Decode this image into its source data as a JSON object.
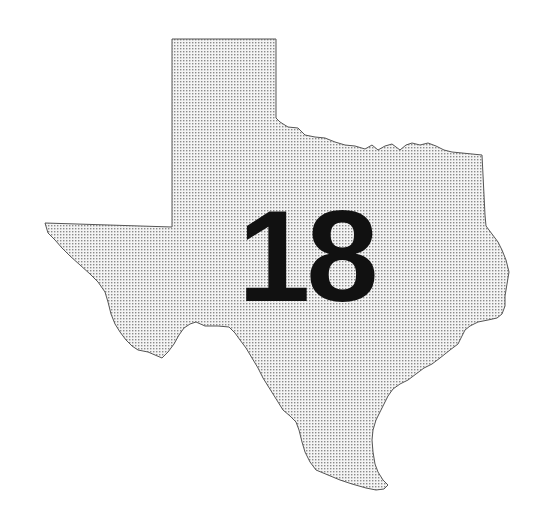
{
  "map": {
    "region_name": "Texas",
    "label": "18",
    "fill_color": "#f2f2f2",
    "dot_color": "#8a8a8a",
    "outline_color": "#555555",
    "label_color": "#111111"
  }
}
